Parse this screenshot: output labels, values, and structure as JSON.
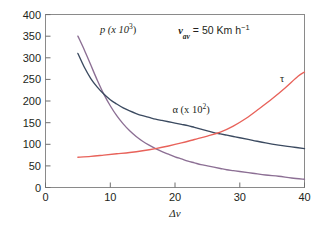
{
  "chart_data": {
    "type": "line",
    "title": "",
    "xlabel": "Δv",
    "ylabel": "",
    "xlim": [
      0,
      40
    ],
    "ylim": [
      0,
      400
    ],
    "xticks": [
      "0",
      "10",
      "20",
      "30",
      "40"
    ],
    "yticks": [
      "0",
      "50",
      "100",
      "150",
      "200",
      "250",
      "300",
      "350",
      "400"
    ],
    "grid": false,
    "legend_position": "inline-annotations",
    "annotations": [
      {
        "name": "condition",
        "text": "v",
        "sub": "av",
        "rest": " = 50 Km h",
        "sup": "−1",
        "x": 20.5,
        "y": 355
      }
    ],
    "series": [
      {
        "name": "p",
        "label": "p (x 10",
        "label_sup": "3",
        "label_tail": ")",
        "color": "#8c6f94",
        "label_x": 8.4,
        "label_y": 357,
        "x": [
          5,
          6,
          7,
          8,
          9,
          10,
          11,
          12,
          13,
          14,
          15,
          16,
          17,
          18,
          19,
          20,
          21,
          22,
          23,
          24,
          25,
          26,
          27,
          28,
          29,
          30,
          32,
          34,
          36,
          38,
          40
        ],
        "y": [
          350,
          318,
          283,
          248,
          216,
          189,
          166,
          147,
          131,
          118,
          107,
          98,
          90,
          83,
          77,
          71,
          66,
          61,
          57,
          53,
          50,
          47,
          44,
          41,
          39,
          37,
          33,
          29,
          26,
          22,
          19
        ]
      },
      {
        "name": "alpha",
        "label": "α (x 10",
        "label_sup": "2",
        "label_tail": ")",
        "color": "#3b4a60",
        "label_x": 19.6,
        "label_y": 172,
        "x": [
          5,
          6,
          7,
          8,
          9,
          10,
          11,
          12,
          13,
          14,
          15,
          16,
          17,
          18,
          19,
          20,
          21,
          22,
          23,
          24,
          25,
          26,
          27,
          28,
          29,
          30,
          32,
          34,
          36,
          38,
          40
        ],
        "y": [
          310,
          278,
          252,
          232,
          216,
          203,
          193,
          184,
          177,
          171,
          166,
          162,
          158,
          155,
          152,
          149,
          146,
          143,
          139,
          135,
          131,
          127,
          124,
          121,
          118,
          115,
          109,
          103,
          98,
          94,
          90
        ]
      },
      {
        "name": "tau",
        "label": "τ",
        "color": "#e8625a",
        "label_x": 36.2,
        "label_y": 243,
        "x": [
          5,
          7,
          9,
          11,
          13,
          15,
          17,
          19,
          21,
          23,
          25,
          27,
          29,
          31,
          33,
          35,
          37,
          39,
          40
        ],
        "y": [
          70,
          72,
          75,
          78,
          81,
          85,
          90,
          96,
          103,
          111,
          119,
          128,
          142,
          160,
          182,
          205,
          230,
          257,
          267
        ]
      }
    ]
  }
}
